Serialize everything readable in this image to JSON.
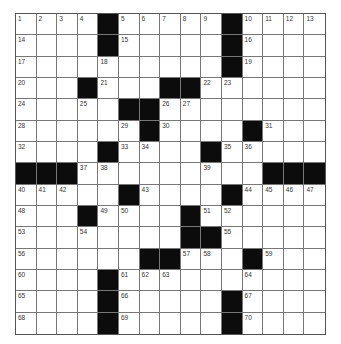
{
  "puzzle": {
    "rows": 15,
    "cols": 15,
    "colors": {
      "black": "#0c0c0c",
      "white": "#ffffff",
      "line": "#777777",
      "number": "#333333"
    },
    "grid": [
      [
        "1",
        "2",
        "3",
        "4",
        "#",
        "5",
        "6",
        "7",
        "8",
        "9",
        "#",
        "10",
        "11",
        "12",
        "13"
      ],
      [
        "14",
        "",
        "",
        "",
        "#",
        "15",
        "",
        "",
        "",
        "",
        "#",
        "16",
        "",
        "",
        ""
      ],
      [
        "17",
        "",
        "",
        "",
        "18",
        "",
        "",
        "",
        "",
        "",
        "#",
        "19",
        "",
        "",
        ""
      ],
      [
        "20",
        "",
        "",
        "#",
        "21",
        "",
        "",
        "#",
        "#",
        "22",
        "23",
        "",
        "",
        "",
        ""
      ],
      [
        "24",
        "",
        "",
        "25",
        "",
        "#",
        "#",
        "26",
        "27",
        "",
        "",
        "",
        "",
        "",
        ""
      ],
      [
        "28",
        "",
        "",
        "",
        "",
        "29",
        "#",
        "30",
        "",
        "",
        "",
        "#",
        "31",
        "",
        ""
      ],
      [
        "32",
        "",
        "",
        "",
        "#",
        "33",
        "34",
        "",
        "",
        "#",
        "35",
        "36",
        "",
        "",
        ""
      ],
      [
        "#",
        "#",
        "#",
        "37",
        "38",
        "",
        "",
        "",
        "",
        "39",
        "",
        "",
        "#",
        "#",
        "#"
      ],
      [
        "40",
        "41",
        "42",
        "",
        "",
        "#",
        "43",
        "",
        "",
        "",
        "#",
        "44",
        "45",
        "46",
        "47"
      ],
      [
        "48",
        "",
        "",
        "#",
        "49",
        "50",
        "",
        "",
        "#",
        "51",
        "52",
        "",
        "",
        "",
        ""
      ],
      [
        "53",
        "",
        "",
        "54",
        "",
        "",
        "",
        "",
        "#",
        "#",
        "55",
        "",
        "",
        "",
        ""
      ],
      [
        "56",
        "",
        "",
        "",
        "",
        "",
        "#",
        "#",
        "57",
        "58",
        "",
        "#",
        "59",
        "",
        ""
      ],
      [
        "60",
        "",
        "",
        "",
        "#",
        "61",
        "62",
        "63",
        "",
        "",
        "",
        "64",
        "",
        "",
        ""
      ],
      [
        "65",
        "",
        "",
        "",
        "#",
        "66",
        "",
        "",
        "",
        "",
        "#",
        "67",
        "",
        "",
        ""
      ],
      [
        "68",
        "",
        "",
        "",
        "#",
        "69",
        "",
        "",
        "",
        "",
        "#",
        "70",
        "",
        "",
        ""
      ]
    ]
  }
}
